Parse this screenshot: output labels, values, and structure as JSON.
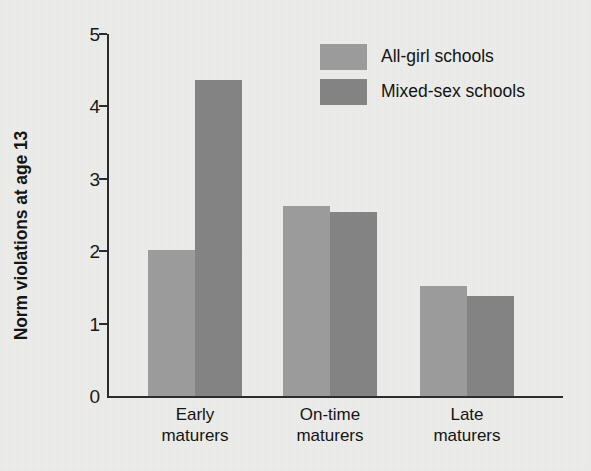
{
  "chart_data": {
    "type": "bar",
    "title": "",
    "subtitle": "",
    "xlabel": "",
    "ylabel": "Norm violations at age 13",
    "categories": [
      "Early\nmaturers",
      "On-time\nmaturers",
      "Late\nmaturers"
    ],
    "series": [
      {
        "name": "All-girl schools",
        "values": [
          2.02,
          2.62,
          1.52
        ],
        "color": "#9c9c9c"
      },
      {
        "name": "Mixed-sex schools",
        "values": [
          4.37,
          2.54,
          1.38
        ],
        "color": "#848484"
      }
    ],
    "ylim": [
      0,
      5
    ],
    "y_ticks": [
      0,
      1,
      2,
      3,
      4,
      5
    ],
    "y_tick_labels": [
      "0",
      "1",
      "2",
      "3",
      "4",
      "5"
    ],
    "grid": false,
    "legend_position": "top-right",
    "background_color": "#ececea",
    "axis_color": "#2b2b2b"
  }
}
